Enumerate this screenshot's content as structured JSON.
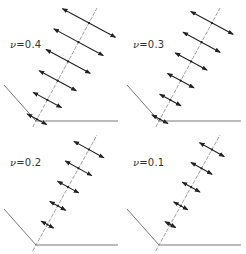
{
  "figure": {
    "colors": {
      "line": "#555555",
      "arrow": "#222222",
      "axis": "#777777"
    },
    "panels": [
      {
        "id": "p1",
        "symbol": "ν",
        "eq": "=0.4",
        "nu": 0.4,
        "label_pos": [
          10,
          39
        ],
        "origin": [
          36,
          121
        ],
        "axis_end": [
          97,
          8
        ],
        "arrow_halflens": [
          11,
          16,
          21,
          25,
          28,
          30
        ]
      },
      {
        "id": "p2",
        "symbol": "ν",
        "eq": "=0.3",
        "nu": 0.3,
        "label_pos": [
          10,
          39
        ],
        "origin": [
          36,
          121
        ],
        "axis_end": [
          97,
          8
        ],
        "arrow_halflens": [
          9,
          12,
          15,
          18,
          21,
          24
        ]
      },
      {
        "id": "p3",
        "symbol": "ν",
        "eq": "=0.2",
        "nu": 0.2,
        "label_pos": [
          10,
          30
        ],
        "origin": [
          36,
          118
        ],
        "axis_end": [
          97,
          8
        ],
        "arrow_halflens": [
          0,
          7,
          9,
          12,
          15,
          17
        ]
      },
      {
        "id": "p4",
        "symbol": "ν",
        "eq": "=0.1",
        "nu": 0.1,
        "label_pos": [
          10,
          30
        ],
        "origin": [
          36,
          118
        ],
        "axis_end": [
          97,
          8
        ],
        "arrow_halflens": [
          0,
          6,
          8,
          10,
          12,
          14
        ]
      }
    ]
  }
}
